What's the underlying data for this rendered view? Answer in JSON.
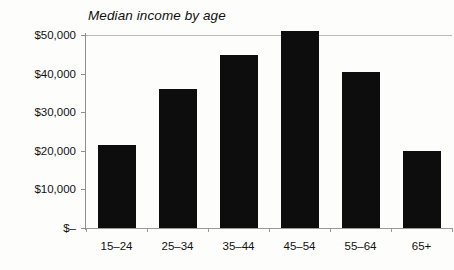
{
  "chart_data": {
    "type": "bar",
    "title": "Median income by age",
    "xlabel": "",
    "ylabel": "",
    "categories": [
      "15–24",
      "25–34",
      "35–44",
      "45–54",
      "55–64",
      "65+"
    ],
    "values": [
      21500,
      36000,
      44700,
      51000,
      40300,
      20000
    ],
    "ylim": [
      0,
      50000
    ],
    "ytick_values": [
      50000,
      40000,
      30000,
      20000,
      10000,
      0
    ],
    "ytick_labels": [
      "$50,000",
      "$40,000",
      "$30,000",
      "$20,000",
      "$10,000",
      "$–"
    ],
    "gridlines": [
      50000
    ],
    "grid": true,
    "legend": null,
    "bar_color": "#0d0d0d",
    "background_color": "#fdfdfb",
    "axis_color": "#8e8e8e",
    "gridline_color": "#b9b9b9"
  }
}
